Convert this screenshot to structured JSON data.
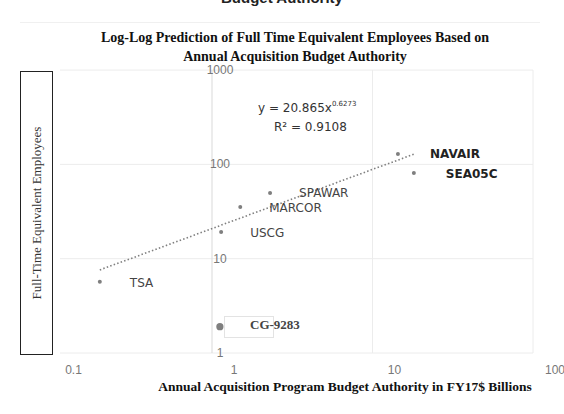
{
  "page": {
    "cut_off_heading": "Budget Authority"
  },
  "chart_data": {
    "type": "scatter",
    "title": "Log-Log Prediction of Full Time Equivalent Employees Based on Annual Acquisition Budget Authority",
    "title_lines": [
      "Log-Log Prediction of Full Time Equivalent Employees Based on",
      "Annual Acquisition Budget Authority"
    ],
    "xlabel": "Annual Acquisition Program Budget Authority in FY17$ Billions",
    "ylabel": "Full-Time Equivalent Employees",
    "x_scale": "log",
    "y_scale": "log",
    "xlim": [
      0.1,
      100
    ],
    "ylim": [
      1,
      1000
    ],
    "x_ticks": [
      "0.1",
      "1",
      "10",
      "100"
    ],
    "y_ticks": [
      "1",
      "10",
      "100",
      "1000"
    ],
    "grid": true,
    "legend": null,
    "points": [
      {
        "label": "TSA",
        "x": 0.2,
        "y": 5.7,
        "label_bold": false
      },
      {
        "label": "USCG",
        "x": 1.14,
        "y": 19.2,
        "label_bold": false
      },
      {
        "label": "MARCOR",
        "x": 1.5,
        "y": 35.3,
        "label_bold": false
      },
      {
        "label": "SPAWAR",
        "x": 2.3,
        "y": 49.8,
        "label_bold": false
      },
      {
        "label": "NAVAIR",
        "x": 14.4,
        "y": 129,
        "label_bold": true
      },
      {
        "label": "SEA05C",
        "x": 18.1,
        "y": 81,
        "label_bold": true
      },
      {
        "label": "CG-9283",
        "x": 1.12,
        "y": 1.9,
        "label_bold": true,
        "highlighted": true
      }
    ],
    "trendline": {
      "type": "power",
      "coefficient": 20.865,
      "exponent": 0.6273,
      "r_squared": 0.9108,
      "x_range": [
        0.2,
        18.1
      ],
      "style": "dotted"
    },
    "annotations": {
      "equation_main": "y = 20.865x",
      "equation_exp": "0.6273",
      "r_squared_text": "R² = 0.9108"
    },
    "colors": {
      "marker": "#7f7f7f",
      "trendline": "#7f7f7f",
      "gridline": "#ececec",
      "axis": "#d9d9d9"
    }
  }
}
